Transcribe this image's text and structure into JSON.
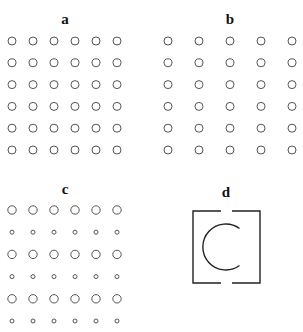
{
  "panels": {
    "a": {
      "label": "a",
      "rows": 6,
      "cols": 6,
      "x0": 12,
      "dx": 21,
      "y0": 41,
      "dy": 21.8,
      "r": 4
    },
    "b": {
      "label": "b",
      "rows": 6,
      "cols": 5,
      "x0": 168,
      "dx": 31,
      "y0": 41,
      "dy": 21.8,
      "r": 4
    },
    "c": {
      "label": "c",
      "rows": 6,
      "cols": 6,
      "x0": 12,
      "dx": 21,
      "y0": 210,
      "dy": 22.2,
      "r_large": 4.2,
      "r_small": 2,
      "pattern": [
        "large",
        "small",
        "large",
        "small",
        "large",
        "small"
      ]
    },
    "d": {
      "label": "d"
    }
  },
  "colors": {
    "stroke": "#555555",
    "text": "#111111"
  }
}
